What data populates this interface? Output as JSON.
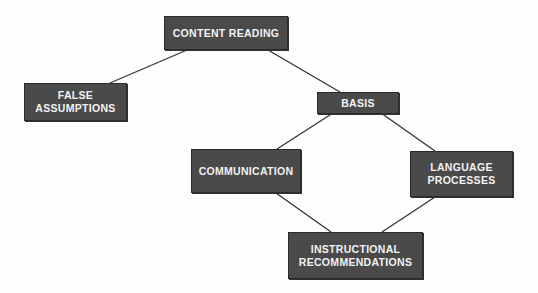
{
  "diagram": {
    "type": "concept-map",
    "colors": {
      "box_fill": "#4a4a4a",
      "box_text": "#f2f2f2",
      "line": "#333333",
      "background": "#fdfdfd"
    },
    "nodes": [
      {
        "id": "content-reading",
        "label": "CONTENT READING",
        "x": 164,
        "y": 16,
        "w": 124,
        "h": 34
      },
      {
        "id": "false-assumptions",
        "label": "FALSE ASSUMPTIONS",
        "x": 24,
        "y": 83,
        "w": 103,
        "h": 38
      },
      {
        "id": "basis",
        "label": "BASIS",
        "x": 317,
        "y": 92,
        "w": 82,
        "h": 22
      },
      {
        "id": "communication",
        "label": "COMMUNICATION",
        "x": 191,
        "y": 149,
        "w": 110,
        "h": 44
      },
      {
        "id": "language-processes",
        "label": "LANGUAGE PROCESSES",
        "x": 410,
        "y": 151,
        "w": 103,
        "h": 46
      },
      {
        "id": "instructional-recommendations",
        "label": "INSTRUCTIONAL RECOMMENDATIONS",
        "x": 288,
        "y": 232,
        "w": 135,
        "h": 47
      }
    ],
    "edges": [
      {
        "from": "content-reading",
        "to": "false-assumptions",
        "x1": 187,
        "y1": 50,
        "x2": 110,
        "y2": 83
      },
      {
        "from": "content-reading",
        "to": "basis",
        "x1": 268,
        "y1": 50,
        "x2": 340,
        "y2": 92
      },
      {
        "from": "basis",
        "to": "communication",
        "x1": 333,
        "y1": 113,
        "x2": 277,
        "y2": 149
      },
      {
        "from": "basis",
        "to": "language-processes",
        "x1": 381,
        "y1": 113,
        "x2": 435,
        "y2": 151
      },
      {
        "from": "communication",
        "to": "instructional-recommendations",
        "x1": 276,
        "y1": 193,
        "x2": 331,
        "y2": 232
      },
      {
        "from": "language-processes",
        "to": "instructional-recommendations",
        "x1": 435,
        "y1": 197,
        "x2": 382,
        "y2": 232
      }
    ]
  }
}
